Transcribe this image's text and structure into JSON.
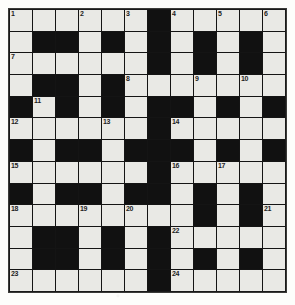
{
  "puzzle": {
    "title": "Crossword grid",
    "columns": 12,
    "rows": 13,
    "colors": {
      "page_background": "#fdfdfb",
      "cell_white": "#e9e9e5",
      "cell_block": "#111111",
      "grid_line": "#141414",
      "number_text": "#1d1d1d"
    },
    "clue_number_count": 24,
    "clue_numbers": [
      1,
      2,
      3,
      4,
      5,
      6,
      7,
      8,
      9,
      10,
      11,
      12,
      13,
      14,
      15,
      16,
      17,
      18,
      19,
      20,
      21,
      22,
      23,
      24
    ],
    "grid": [
      [
        {
          "block": false,
          "num": "1"
        },
        {
          "block": false,
          "num": ""
        },
        {
          "block": false,
          "num": ""
        },
        {
          "block": false,
          "num": "2"
        },
        {
          "block": false,
          "num": ""
        },
        {
          "block": false,
          "num": "3"
        },
        {
          "block": true,
          "num": ""
        },
        {
          "block": false,
          "num": "4"
        },
        {
          "block": false,
          "num": ""
        },
        {
          "block": false,
          "num": "5"
        },
        {
          "block": false,
          "num": ""
        },
        {
          "block": false,
          "num": "6"
        }
      ],
      [
        {
          "block": false,
          "num": ""
        },
        {
          "block": true,
          "num": ""
        },
        {
          "block": true,
          "num": ""
        },
        {
          "block": false,
          "num": ""
        },
        {
          "block": true,
          "num": ""
        },
        {
          "block": false,
          "num": ""
        },
        {
          "block": true,
          "num": ""
        },
        {
          "block": false,
          "num": ""
        },
        {
          "block": true,
          "num": ""
        },
        {
          "block": false,
          "num": ""
        },
        {
          "block": true,
          "num": ""
        },
        {
          "block": false,
          "num": ""
        }
      ],
      [
        {
          "block": false,
          "num": "7"
        },
        {
          "block": false,
          "num": ""
        },
        {
          "block": false,
          "num": ""
        },
        {
          "block": false,
          "num": ""
        },
        {
          "block": false,
          "num": ""
        },
        {
          "block": false,
          "num": ""
        },
        {
          "block": true,
          "num": ""
        },
        {
          "block": false,
          "num": ""
        },
        {
          "block": true,
          "num": ""
        },
        {
          "block": false,
          "num": ""
        },
        {
          "block": true,
          "num": ""
        },
        {
          "block": false,
          "num": ""
        }
      ],
      [
        {
          "block": false,
          "num": ""
        },
        {
          "block": true,
          "num": ""
        },
        {
          "block": true,
          "num": ""
        },
        {
          "block": false,
          "num": ""
        },
        {
          "block": true,
          "num": ""
        },
        {
          "block": false,
          "num": "8"
        },
        {
          "block": false,
          "num": ""
        },
        {
          "block": false,
          "num": ""
        },
        {
          "block": false,
          "num": "9"
        },
        {
          "block": false,
          "num": ""
        },
        {
          "block": false,
          "num": "10"
        },
        {
          "block": false,
          "num": ""
        }
      ],
      [
        {
          "block": true,
          "num": ""
        },
        {
          "block": false,
          "num": "11"
        },
        {
          "block": true,
          "num": ""
        },
        {
          "block": false,
          "num": ""
        },
        {
          "block": true,
          "num": ""
        },
        {
          "block": false,
          "num": ""
        },
        {
          "block": true,
          "num": ""
        },
        {
          "block": true,
          "num": ""
        },
        {
          "block": false,
          "num": ""
        },
        {
          "block": true,
          "num": ""
        },
        {
          "block": false,
          "num": ""
        },
        {
          "block": true,
          "num": ""
        }
      ],
      [
        {
          "block": false,
          "num": "12"
        },
        {
          "block": false,
          "num": ""
        },
        {
          "block": false,
          "num": ""
        },
        {
          "block": false,
          "num": ""
        },
        {
          "block": false,
          "num": "13"
        },
        {
          "block": false,
          "num": ""
        },
        {
          "block": true,
          "num": ""
        },
        {
          "block": false,
          "num": "14"
        },
        {
          "block": false,
          "num": ""
        },
        {
          "block": false,
          "num": ""
        },
        {
          "block": false,
          "num": ""
        },
        {
          "block": false,
          "num": ""
        }
      ],
      [
        {
          "block": true,
          "num": ""
        },
        {
          "block": false,
          "num": ""
        },
        {
          "block": true,
          "num": ""
        },
        {
          "block": true,
          "num": ""
        },
        {
          "block": false,
          "num": ""
        },
        {
          "block": true,
          "num": ""
        },
        {
          "block": true,
          "num": ""
        },
        {
          "block": true,
          "num": ""
        },
        {
          "block": false,
          "num": ""
        },
        {
          "block": true,
          "num": ""
        },
        {
          "block": false,
          "num": ""
        },
        {
          "block": true,
          "num": ""
        }
      ],
      [
        {
          "block": false,
          "num": "15"
        },
        {
          "block": false,
          "num": ""
        },
        {
          "block": false,
          "num": ""
        },
        {
          "block": false,
          "num": ""
        },
        {
          "block": false,
          "num": ""
        },
        {
          "block": false,
          "num": ""
        },
        {
          "block": true,
          "num": ""
        },
        {
          "block": false,
          "num": "16"
        },
        {
          "block": false,
          "num": ""
        },
        {
          "block": false,
          "num": "17"
        },
        {
          "block": false,
          "num": ""
        },
        {
          "block": false,
          "num": ""
        }
      ],
      [
        {
          "block": true,
          "num": ""
        },
        {
          "block": false,
          "num": ""
        },
        {
          "block": true,
          "num": ""
        },
        {
          "block": true,
          "num": ""
        },
        {
          "block": false,
          "num": ""
        },
        {
          "block": true,
          "num": ""
        },
        {
          "block": true,
          "num": ""
        },
        {
          "block": false,
          "num": ""
        },
        {
          "block": true,
          "num": ""
        },
        {
          "block": false,
          "num": ""
        },
        {
          "block": true,
          "num": ""
        },
        {
          "block": false,
          "num": ""
        }
      ],
      [
        {
          "block": false,
          "num": "18"
        },
        {
          "block": false,
          "num": ""
        },
        {
          "block": false,
          "num": ""
        },
        {
          "block": false,
          "num": "19"
        },
        {
          "block": false,
          "num": ""
        },
        {
          "block": false,
          "num": "20"
        },
        {
          "block": false,
          "num": ""
        },
        {
          "block": false,
          "num": ""
        },
        {
          "block": true,
          "num": ""
        },
        {
          "block": false,
          "num": ""
        },
        {
          "block": true,
          "num": ""
        },
        {
          "block": false,
          "num": "21"
        }
      ],
      [
        {
          "block": false,
          "num": ""
        },
        {
          "block": true,
          "num": ""
        },
        {
          "block": true,
          "num": ""
        },
        {
          "block": false,
          "num": ""
        },
        {
          "block": true,
          "num": ""
        },
        {
          "block": false,
          "num": ""
        },
        {
          "block": true,
          "num": ""
        },
        {
          "block": false,
          "num": "22"
        },
        {
          "block": false,
          "num": ""
        },
        {
          "block": false,
          "num": ""
        },
        {
          "block": false,
          "num": ""
        },
        {
          "block": false,
          "num": ""
        }
      ],
      [
        {
          "block": false,
          "num": ""
        },
        {
          "block": true,
          "num": ""
        },
        {
          "block": true,
          "num": ""
        },
        {
          "block": false,
          "num": ""
        },
        {
          "block": true,
          "num": ""
        },
        {
          "block": false,
          "num": ""
        },
        {
          "block": true,
          "num": ""
        },
        {
          "block": false,
          "num": ""
        },
        {
          "block": true,
          "num": ""
        },
        {
          "block": false,
          "num": ""
        },
        {
          "block": true,
          "num": ""
        },
        {
          "block": false,
          "num": ""
        }
      ],
      [
        {
          "block": false,
          "num": "23"
        },
        {
          "block": false,
          "num": ""
        },
        {
          "block": false,
          "num": ""
        },
        {
          "block": false,
          "num": ""
        },
        {
          "block": false,
          "num": ""
        },
        {
          "block": false,
          "num": ""
        },
        {
          "block": true,
          "num": ""
        },
        {
          "block": false,
          "num": "24"
        },
        {
          "block": false,
          "num": ""
        },
        {
          "block": false,
          "num": ""
        },
        {
          "block": false,
          "num": ""
        },
        {
          "block": false,
          "num": ""
        }
      ]
    ]
  }
}
